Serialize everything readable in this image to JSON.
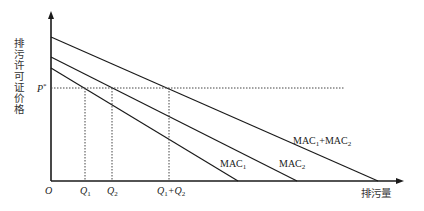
{
  "diagram": {
    "y_axis_label": "排污许可证价格",
    "x_axis_label": "排污量",
    "origin_label": "O",
    "price_label": {
      "base": "P",
      "sup": "*"
    },
    "q_labels": [
      {
        "base": "Q",
        "sub": "1"
      },
      {
        "base": "Q",
        "sub": "2"
      },
      {
        "base": "Q",
        "sub": "1",
        "plus": "+Q",
        "sub2": "2"
      }
    ],
    "curves": [
      {
        "name": "MAC",
        "sub": "1",
        "y_intercept": 68,
        "x_intercept": 238
      },
      {
        "name": "MAC",
        "sub": "2",
        "y_intercept": 57,
        "x_intercept": 297
      },
      {
        "name": "MAC",
        "sub": "1",
        "plus": "+MAC",
        "sub2": "2",
        "y_intercept": 37,
        "x_intercept": 378
      }
    ],
    "p_star_y": 88,
    "colors": {
      "line": "#1a1a1a",
      "dotted": "#444444"
    }
  }
}
